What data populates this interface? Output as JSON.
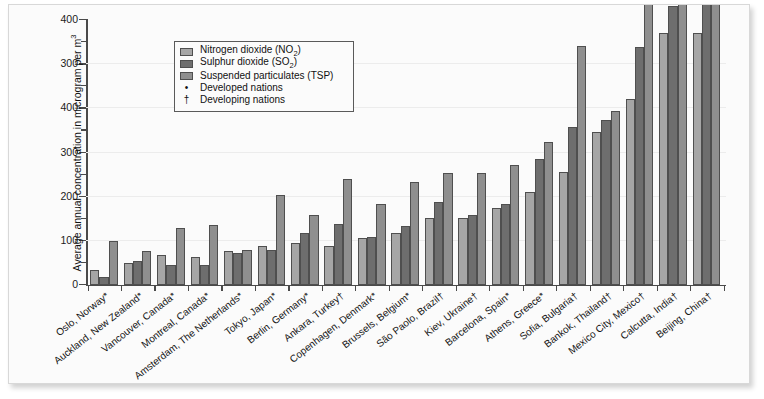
{
  "chart_data": {
    "type": "bar",
    "title": "",
    "xlabel": "",
    "ylabel": "Average annual concentration in microgram per m3",
    "ylim": [
      0,
      400
    ],
    "yticks": [
      0,
      100,
      200,
      300,
      400
    ],
    "ytick_labels_as_printed": [
      "400",
      "300",
      "400",
      "300",
      "200",
      "100",
      "0"
    ],
    "grid": true,
    "legend_position": "top-left-inside",
    "categories": [
      "Oslo, Norway*",
      "Auckland, New Zealand*",
      "Vancouver, Canada*",
      "Montreal, Canada*",
      "Amsterdam, The Netherlands*",
      "Tokyo, Japan*",
      "Berlin, Germany*",
      "Ankara, Turkey†",
      "Copenhagen, Denmark*",
      "Brussels, Belgium*",
      "São Paolo, Brazil†",
      "Kiev, Ukraine†",
      "Barcelona, Spain*",
      "Athens, Greece*",
      "Sofia, Bulgaria†",
      "Bankok, Thailand†",
      "Mexico City, Mexico†",
      "Calcutta, India†",
      "Beijing, China†"
    ],
    "series": [
      {
        "name": "Nitrogen dioxide (NO2)",
        "color": "#a6a6a6",
        "values": [
          22,
          32,
          44,
          42,
          50,
          58,
          62,
          58,
          70,
          78,
          100,
          100,
          115,
          140,
          170,
          230,
          280,
          380,
          380
        ]
      },
      {
        "name": "Sulphur dioxide (SO2)",
        "color": "#6e6e6e",
        "values": [
          12,
          36,
          30,
          30,
          48,
          52,
          78,
          92,
          72,
          88,
          125,
          105,
          122,
          190,
          238,
          248,
          358,
          420,
          470
        ]
      },
      {
        "name": "Suspended particulates (TSP)",
        "color": "#8f8f8f",
        "values": [
          65,
          50,
          85,
          90,
          52,
          135,
          105,
          160,
          122,
          155,
          168,
          168,
          180,
          215,
          360,
          262,
          488,
          440,
          620
        ]
      }
    ],
    "annotations": {
      "developed_marker": "•",
      "developing_marker": "†"
    }
  },
  "legend": {
    "entries": [
      {
        "kind": "swatch",
        "series": 0,
        "label_main": "Nitrogen dioxide (NO",
        "label_sub": "2",
        "label_tail": ")"
      },
      {
        "kind": "swatch",
        "series": 1,
        "label_main": "Sulphur dioxide (SO",
        "label_sub": "2",
        "label_tail": ")"
      },
      {
        "kind": "swatch",
        "series": 2,
        "label_main": "Suspended particulates (TSP)",
        "label_sub": "",
        "label_tail": ""
      },
      {
        "kind": "mark",
        "mark": "•",
        "label_main": "Developed nations",
        "label_sub": "",
        "label_tail": ""
      },
      {
        "kind": "mark",
        "mark": "†",
        "label_main": "Developing nations",
        "label_sub": "",
        "label_tail": ""
      }
    ]
  },
  "y_axis": {
    "title_main": "Average annual concentration in microgram per m",
    "title_sup": "3",
    "printed_labels": [
      "400",
      "300",
      "400",
      "300",
      "200",
      "100",
      "0"
    ]
  }
}
